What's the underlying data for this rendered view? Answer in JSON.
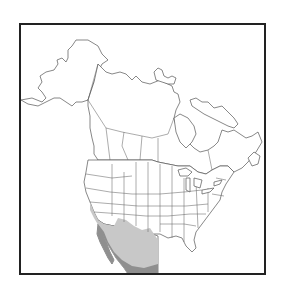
{
  "map": {
    "title": "Range map of North America",
    "region": "North America",
    "countries": [
      "Canada",
      "United States",
      "Mexico"
    ],
    "legend": [
      {
        "label": "Range (light)",
        "color": "#c8c8c8"
      },
      {
        "label": "Range (dark)",
        "color": "#8f8f8f"
      }
    ],
    "colors": {
      "background": "#ffffff",
      "frame": "#222222",
      "land_fill": "#ffffff",
      "outline": "#555555",
      "range_light": "#c8c8c8",
      "range_dark": "#8f8f8f"
    }
  }
}
